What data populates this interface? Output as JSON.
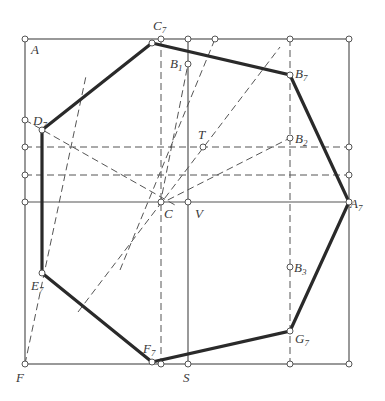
{
  "diagram": {
    "colors": {
      "thin": "#555555",
      "thick": "#2a2a2a",
      "dashed": "#555555",
      "background": "#ffffff"
    },
    "square": {
      "x1": 25,
      "y1": 39,
      "x2": 349,
      "y2": 364
    },
    "solid_lines": [
      {
        "name": "vertical-s-line",
        "x1": 188,
        "y1": 39,
        "x2": 188,
        "y2": 364
      },
      {
        "name": "horizontal-a7-line",
        "x1": 25,
        "y1": 202,
        "x2": 349,
        "y2": 202
      }
    ],
    "dashed_lines": [
      {
        "name": "horizontal-t-line",
        "x1": 25,
        "y1": 147,
        "x2": 349,
        "y2": 147
      },
      {
        "name": "horizontal-lower-line",
        "x1": 25,
        "y1": 175,
        "x2": 349,
        "y2": 175
      },
      {
        "name": "vertical-c-line",
        "x1": 161,
        "y1": 39,
        "x2": 161,
        "y2": 364
      },
      {
        "name": "vertical-b-line",
        "x1": 290,
        "y1": 39,
        "x2": 290,
        "y2": 364
      },
      {
        "name": "diagonal-f-line",
        "x1": 25,
        "y1": 364,
        "x2": 86,
        "y2": 76
      },
      {
        "name": "diagonal-c-b1-line",
        "x1": 160,
        "y1": 205,
        "x2": 188,
        "y2": 64
      },
      {
        "name": "diagonal-long-1",
        "x1": 120,
        "y1": 270,
        "x2": 215,
        "y2": 39
      },
      {
        "name": "diagonal-long-2",
        "x1": 78,
        "y1": 312,
        "x2": 280,
        "y2": 47
      },
      {
        "name": "diagonal-d7-c",
        "x1": 25,
        "y1": 120,
        "x2": 175,
        "y2": 205
      },
      {
        "name": "diagonal-c-b2",
        "x1": 158,
        "y1": 205,
        "x2": 290,
        "y2": 138
      }
    ],
    "polygon": {
      "name": "heptagon",
      "points": [
        [
          152,
          43
        ],
        [
          290,
          75
        ],
        [
          349,
          202
        ],
        [
          290,
          331
        ],
        [
          152,
          362
        ],
        [
          42,
          273
        ],
        [
          42,
          130
        ]
      ]
    },
    "points": [
      {
        "cx": 25,
        "cy": 39
      },
      {
        "cx": 161,
        "cy": 39
      },
      {
        "cx": 188,
        "cy": 39
      },
      {
        "cx": 215,
        "cy": 39
      },
      {
        "cx": 290,
        "cy": 39
      },
      {
        "cx": 349,
        "cy": 39
      },
      {
        "cx": 25,
        "cy": 120
      },
      {
        "cx": 25,
        "cy": 147
      },
      {
        "cx": 25,
        "cy": 175
      },
      {
        "cx": 25,
        "cy": 202
      },
      {
        "cx": 349,
        "cy": 147
      },
      {
        "cx": 349,
        "cy": 175
      },
      {
        "cx": 349,
        "cy": 202
      },
      {
        "cx": 25,
        "cy": 364
      },
      {
        "cx": 161,
        "cy": 364
      },
      {
        "cx": 188,
        "cy": 364
      },
      {
        "cx": 290,
        "cy": 364
      },
      {
        "cx": 349,
        "cy": 364
      },
      {
        "cx": 152,
        "cy": 43
      },
      {
        "cx": 290,
        "cy": 75
      },
      {
        "cx": 290,
        "cy": 331
      },
      {
        "cx": 152,
        "cy": 362
      },
      {
        "cx": 42,
        "cy": 273
      },
      {
        "cx": 42,
        "cy": 130
      },
      {
        "cx": 188,
        "cy": 64
      },
      {
        "cx": 290,
        "cy": 138
      },
      {
        "cx": 290,
        "cy": 267
      },
      {
        "cx": 203,
        "cy": 147
      },
      {
        "cx": 161,
        "cy": 202
      },
      {
        "cx": 188,
        "cy": 202
      }
    ],
    "labels": [
      {
        "name": "label-A",
        "text": "A",
        "sub": "",
        "x": 31,
        "y": 54
      },
      {
        "name": "label-C7",
        "text": "C",
        "sub": "7",
        "x": 153,
        "y": 30
      },
      {
        "name": "label-B1",
        "text": "B",
        "sub": "1",
        "x": 170,
        "y": 68
      },
      {
        "name": "label-B7",
        "text": "B",
        "sub": "7",
        "x": 295,
        "y": 78
      },
      {
        "name": "label-D7",
        "text": "D",
        "sub": "7",
        "x": 33,
        "y": 125
      },
      {
        "name": "label-T",
        "text": "T",
        "sub": "",
        "x": 198,
        "y": 139
      },
      {
        "name": "label-B2",
        "text": "B",
        "sub": "2",
        "x": 295,
        "y": 143
      },
      {
        "name": "label-C",
        "text": "C",
        "sub": "",
        "x": 164,
        "y": 218
      },
      {
        "name": "label-V",
        "text": "V",
        "sub": "",
        "x": 195,
        "y": 218
      },
      {
        "name": "label-A7",
        "text": "A",
        "sub": "7",
        "x": 350,
        "y": 208
      },
      {
        "name": "label-B3",
        "text": "B",
        "sub": "3",
        "x": 294,
        "y": 272
      },
      {
        "name": "label-E7",
        "text": "E",
        "sub": "7",
        "x": 31,
        "y": 290
      },
      {
        "name": "label-G7",
        "text": "G",
        "sub": "7",
        "x": 295,
        "y": 343
      },
      {
        "name": "label-F7",
        "text": "F",
        "sub": "7",
        "x": 143,
        "y": 353
      },
      {
        "name": "label-F",
        "text": "F",
        "sub": "",
        "x": 16,
        "y": 382
      },
      {
        "name": "label-S",
        "text": "S",
        "sub": "",
        "x": 183,
        "y": 382
      }
    ]
  }
}
